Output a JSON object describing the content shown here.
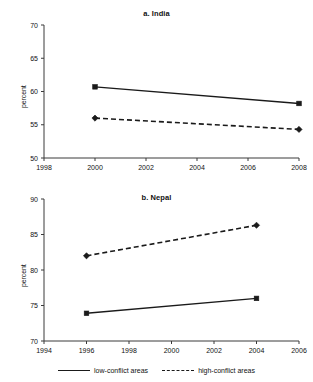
{
  "figure": {
    "ylabel": "percent",
    "legend": [
      {
        "label": "low-conflict areas",
        "style": "solid",
        "marker": "square"
      },
      {
        "label": "high-conflict areas",
        "style": "dashed",
        "marker": "diamond"
      }
    ]
  },
  "chart_data": [
    {
      "type": "line",
      "title": "a. India",
      "xlabel": "",
      "ylabel": "percent",
      "xlim": [
        1998,
        2008
      ],
      "ylim": [
        50,
        70
      ],
      "xticks": [
        1998,
        2000,
        2002,
        2004,
        2006,
        2008
      ],
      "yticks": [
        50,
        55,
        60,
        65,
        70
      ],
      "xtick_labels": [
        "1998",
        "2000",
        "2002",
        "2004",
        "2006",
        "2008"
      ],
      "ytick_labels": [
        "50",
        "55",
        "60",
        "65",
        "70"
      ],
      "grid": false,
      "legend_position": "below-figure",
      "series": [
        {
          "name": "low-conflict areas",
          "style": "solid",
          "marker": "square",
          "x": [
            2000,
            2008
          ],
          "values": [
            60.7,
            58.2
          ]
        },
        {
          "name": "high-conflict areas",
          "style": "dashed",
          "marker": "diamond",
          "x": [
            2000,
            2008
          ],
          "values": [
            56.0,
            54.3
          ]
        }
      ]
    },
    {
      "type": "line",
      "title": "b. Nepal",
      "xlabel": "",
      "ylabel": "percent",
      "xlim": [
        1994,
        2006
      ],
      "ylim": [
        70,
        90
      ],
      "xticks": [
        1994,
        1996,
        1998,
        2000,
        2002,
        2004,
        2006
      ],
      "yticks": [
        70,
        75,
        80,
        85,
        90
      ],
      "xtick_labels": [
        "1994",
        "1996",
        "1998",
        "2000",
        "2002",
        "2004",
        "2006"
      ],
      "ytick_labels": [
        "70",
        "75",
        "80",
        "85",
        "90"
      ],
      "grid": false,
      "legend_position": "below-figure",
      "series": [
        {
          "name": "low-conflict areas",
          "style": "solid",
          "marker": "square",
          "x": [
            1996,
            2004
          ],
          "values": [
            73.9,
            76.0
          ]
        },
        {
          "name": "high-conflict areas",
          "style": "dashed",
          "marker": "diamond",
          "x": [
            1996,
            2004
          ],
          "values": [
            82.0,
            86.3
          ]
        }
      ]
    }
  ]
}
